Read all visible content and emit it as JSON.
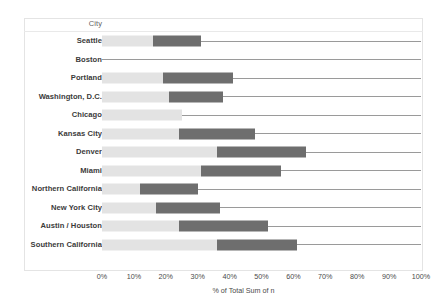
{
  "header": {
    "field_label": "City"
  },
  "axis": {
    "title": "% of Total Sum of n",
    "ticks": [
      "0%",
      "10%",
      "20%",
      "30%",
      "40%",
      "50%",
      "60%",
      "70%",
      "80%",
      "90%",
      "100%"
    ]
  },
  "colors": {
    "light_segment": "#e3e3e3",
    "dark_segment": "#6e6e6e",
    "baseline_rule": "#9a9a9a",
    "frame": "#e4e4e4",
    "label_text": "#3b3b3b"
  },
  "chart_data": {
    "type": "bar",
    "title": "",
    "subtitle": "",
    "orientation": "horizontal",
    "stacked": true,
    "xlabel": "% of Total Sum of n",
    "ylabel": "City",
    "xlim": [
      0,
      100
    ],
    "xticks": [
      0,
      10,
      20,
      30,
      40,
      50,
      60,
      70,
      80,
      90,
      100
    ],
    "grid": false,
    "legend": "none",
    "categories": [
      "Seattle",
      "Boston",
      "Portland",
      "Washington, D.C.",
      "Chicago",
      "Kansas City",
      "Denver",
      "Miami",
      "Northern California",
      "New York City",
      "Austin / Houston",
      "Southern California"
    ],
    "series": [
      {
        "name": "light-segment-end",
        "values": [
          16,
          0,
          19,
          21,
          25,
          24,
          36,
          31,
          12,
          17,
          24,
          36
        ]
      },
      {
        "name": "dark-segment-end",
        "values": [
          31,
          0,
          41,
          38,
          25,
          48,
          64,
          56,
          30,
          37,
          52,
          61
        ]
      },
      {
        "name": "total-end",
        "values": [
          100,
          100,
          100,
          100,
          100,
          100,
          100,
          100,
          100,
          100,
          100,
          100
        ]
      }
    ],
    "rows": [
      {
        "label": "Seattle",
        "light_end": 16,
        "dark_end": 31,
        "total": 100
      },
      {
        "label": "Boston",
        "light_end": 0,
        "dark_end": 0,
        "total": 100
      },
      {
        "label": "Portland",
        "light_end": 19,
        "dark_end": 41,
        "total": 100
      },
      {
        "label": "Washington, D.C.",
        "light_end": 21,
        "dark_end": 38,
        "total": 100
      },
      {
        "label": "Chicago",
        "light_end": 25,
        "dark_end": 25,
        "total": 100
      },
      {
        "label": "Kansas City",
        "light_end": 24,
        "dark_end": 48,
        "total": 100
      },
      {
        "label": "Denver",
        "light_end": 36,
        "dark_end": 64,
        "total": 100
      },
      {
        "label": "Miami",
        "light_end": 31,
        "dark_end": 56,
        "total": 100
      },
      {
        "label": "Northern California",
        "light_end": 12,
        "dark_end": 30,
        "total": 100
      },
      {
        "label": "New York City",
        "light_end": 17,
        "dark_end": 37,
        "total": 100
      },
      {
        "label": "Austin / Houston",
        "light_end": 24,
        "dark_end": 52,
        "total": 100
      },
      {
        "label": "Southern California",
        "light_end": 36,
        "dark_end": 61,
        "total": 100
      }
    ]
  }
}
